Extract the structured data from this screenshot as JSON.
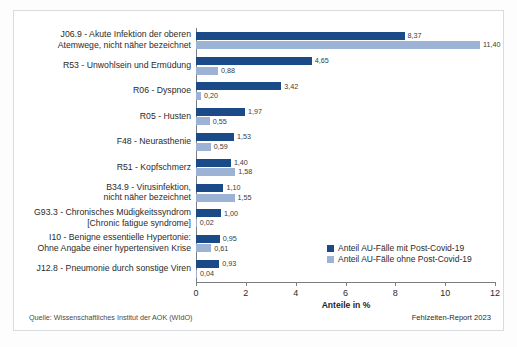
{
  "chart_data": {
    "type": "bar",
    "orientation": "horizontal",
    "title": "",
    "xlabel": "Anteile in %",
    "ylabel": "",
    "xlim": [
      0,
      12
    ],
    "xticks": [
      0,
      2,
      4,
      6,
      8,
      10,
      12
    ],
    "grid": false,
    "legend_position": "inside-right-bottom",
    "categories": [
      "J06.9 - Akute Infektion der oberen\nAtemwege, nicht näher bezeichnet",
      "R53 - Unwohlsein und Ermüdung",
      "R06 - Dyspnoe",
      "R05 - Husten",
      "F48 - Neurasthenie",
      "R51 - Kopfschmerz",
      "B34.9 - Virusinfektion,\nnicht näher bezeichnet",
      "G93.3 - Chronisches Müdigkeitssyndrom\n[Chronic fatigue syndrome]",
      "I10 - Benigne essentielle Hypertonie:\nOhne Angabe einer hypertensiven Krise",
      "J12.8 - Pneumonie durch sonstige Viren"
    ],
    "series": [
      {
        "name": "Anteil AU-Fälle mit Post-Covid-19",
        "color": "#1b4a88",
        "values": [
          8.37,
          4.65,
          3.42,
          1.97,
          1.53,
          1.4,
          1.1,
          1.0,
          0.95,
          0.93
        ],
        "labels": [
          "8,37",
          "4,65",
          "3,42",
          "1,97",
          "1,53",
          "1,40",
          "1,10",
          "1,00",
          "0,95",
          "0,93"
        ]
      },
      {
        "name": "Anteil AU-Fälle ohne Post-Covid-19",
        "color": "#9cb3d6",
        "values": [
          11.4,
          0.88,
          0.2,
          0.55,
          0.59,
          1.58,
          1.55,
          0.02,
          0.61,
          0.04
        ],
        "labels": [
          "11,40",
          "0,88",
          "0,20",
          "0,55",
          "0,59",
          "1,58",
          "1,55",
          "0,02",
          "0,61",
          "0,04"
        ]
      }
    ]
  },
  "footer": {
    "source": "Quelle: Wissenschaftliches Institut der AOK (WIdO)",
    "report": "Fehlzeiten-Report 2023"
  }
}
